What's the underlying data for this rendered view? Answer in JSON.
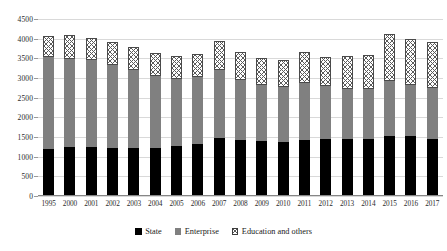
{
  "chart_data": {
    "type": "bar",
    "subtype": "stacked-column",
    "title": "",
    "xlabel": "",
    "ylabel": "",
    "ylim": [
      0,
      4500
    ],
    "ytick_step": 500,
    "yticks": [
      0,
      500,
      1000,
      1500,
      2000,
      2500,
      3000,
      3500,
      4000,
      4500
    ],
    "ytick_labels": [
      "0",
      "500",
      "1000",
      "1500",
      "2000",
      "2500",
      "3000",
      "3500",
      "4000",
      "4500"
    ],
    "grid": true,
    "grid_axis": "y",
    "legend_position": "bottom",
    "categories": [
      "1995",
      "2000",
      "2001",
      "2002",
      "2003",
      "2004",
      "2005",
      "2006",
      "2007",
      "2008",
      "2009",
      "2010",
      "2011",
      "2012",
      "2013",
      "2014",
      "2015",
      "2016",
      "2017"
    ],
    "series": [
      {
        "name": "State",
        "color": "#000000",
        "pattern": "solid",
        "values": [
          1190,
          1245,
          1250,
          1210,
          1225,
          1225,
          1270,
          1325,
          1470,
          1415,
          1390,
          1385,
          1435,
          1440,
          1460,
          1455,
          1530,
          1515,
          1460
        ]
      },
      {
        "name": "Enterprise",
        "color": "#808080",
        "pattern": "solid",
        "values": [
          2345,
          2250,
          2215,
          2110,
          1980,
          1835,
          1700,
          1690,
          1740,
          1535,
          1440,
          1385,
          1430,
          1345,
          1250,
          1265,
          1400,
          1310,
          1285
        ]
      },
      {
        "name": "Education and others",
        "color": "#ffffff",
        "pattern": "checkered",
        "values": [
          525,
          605,
          565,
          590,
          580,
          580,
          580,
          585,
          720,
          700,
          680,
          690,
          785,
          740,
          855,
          855,
          1200,
          1175,
          1165
        ]
      }
    ],
    "totals": [
      4060,
      4100,
      4030,
      3910,
      3785,
      3640,
      3550,
      3600,
      3930,
      3650,
      3510,
      3460,
      3650,
      3525,
      3565,
      3575,
      4130,
      4000,
      3910
    ]
  },
  "legend": {
    "items": [
      {
        "label": "State",
        "swatch": "state-swatch"
      },
      {
        "label": "Enterprise",
        "swatch": "enterprise-swatch"
      },
      {
        "label": "Education and others",
        "swatch": "education-and-others-swatch"
      }
    ]
  },
  "colors": {
    "state": "#000000",
    "enterprise": "#808080",
    "education_and_others": "#ffffff",
    "gridline": "#d9d9d9",
    "axis": "#868686",
    "text": "#2b2b2b",
    "background": "#ffffff"
  }
}
